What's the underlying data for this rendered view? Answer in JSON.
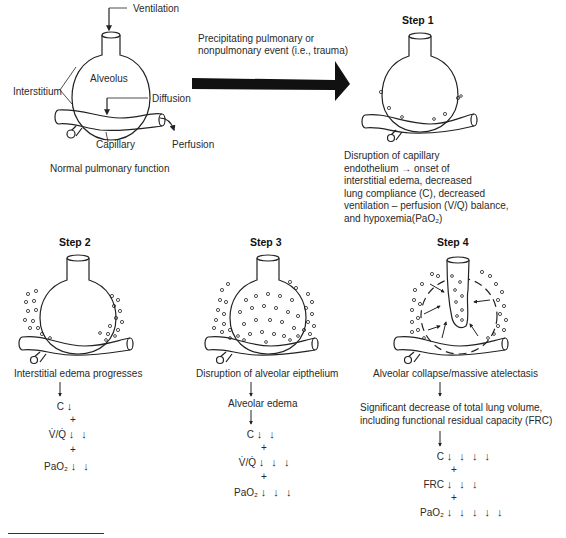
{
  "normal": {
    "labels": {
      "ventilation": "Ventilation",
      "alveolus": "Alveolus",
      "interstitium": "Interstitium",
      "diffusion": "Diffusion",
      "capillary": "Capillary",
      "perfusion": "Perfusion"
    },
    "caption": "Normal pulmonary function"
  },
  "transition": {
    "line1": "Precipitating pulmonary or",
    "line2": "nonpulmonary event (i.e., trauma)"
  },
  "step1": {
    "title": "Step 1",
    "desc": [
      "Disruption of capillary",
      "endothelium →  onset of",
      "interstitial edema, decreased",
      "lung compliance (C), decreased",
      "ventilation – perfusion (V/Q) balance,",
      "and hypoxemia(PaO₂)"
    ]
  },
  "step2": {
    "title": "Step 2",
    "caption": "Interstitial edema progresses",
    "effects": [
      {
        "label": "C",
        "arrows": "↓"
      },
      {
        "label": "V̇/Q̇",
        "arrows": "↓ ↓"
      },
      {
        "label": "PaO₂",
        "arrows": "↓ ↓"
      }
    ]
  },
  "step3": {
    "title": "Step 3",
    "caption": "Disruption of alveolar eipthelium",
    "intermediate": "Alveolar edema",
    "effects": [
      {
        "label": "C",
        "arrows": "↓ ↓"
      },
      {
        "label": "V̇/Q̇",
        "arrows": "↓ ↓ ↓"
      },
      {
        "label": "PaO₂",
        "arrows": "↓ ↓ ↓"
      }
    ]
  },
  "step4": {
    "title": "Step 4",
    "caption": "Alveolar collapse/massive atelectasis",
    "intermediate_line1": "Significant decrease of total lung volume,",
    "intermediate_line2": "including functional residual capacity (FRC)",
    "effects": [
      {
        "label": "C",
        "arrows": "↓ ↓ ↓ ↓"
      },
      {
        "label": "FRC",
        "arrows": "↓ ↓ ↓"
      },
      {
        "label": "PaO₂",
        "arrows": "↓ ↓ ↓ ↓ ↓"
      }
    ]
  },
  "plus": "+"
}
